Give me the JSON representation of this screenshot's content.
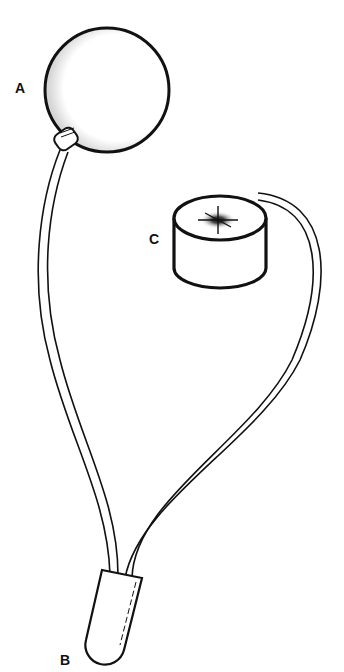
{
  "diagram": {
    "type": "apparatus-line-drawing",
    "components": [
      {
        "id": "A",
        "label": "A",
        "shape": "sphere with nozzle"
      },
      {
        "id": "B",
        "label": "B",
        "shape": "capsule connector"
      },
      {
        "id": "C",
        "label": "C",
        "shape": "cylinder with starburst top"
      }
    ],
    "connections": [
      {
        "from": "A",
        "to": "B",
        "shape": "double-line tube"
      },
      {
        "from": "C",
        "to": "B",
        "shape": "double-line tube"
      }
    ],
    "colors": {
      "line": "#111111",
      "background": "#ffffff"
    }
  }
}
